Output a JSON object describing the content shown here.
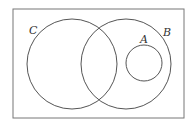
{
  "diagram": {
    "type": "venn",
    "universe": {
      "x": 13,
      "y": 9,
      "width": 171,
      "height": 109
    },
    "sets": [
      {
        "id": "C",
        "label": "C",
        "cx": 72,
        "cy": 64,
        "r": 45,
        "label_x": 29,
        "label_y": 34
      },
      {
        "id": "B",
        "label": "B",
        "cx": 126,
        "cy": 64,
        "r": 45,
        "label_x": 163,
        "label_y": 36
      },
      {
        "id": "A",
        "label": "A",
        "cx": 144,
        "cy": 63,
        "r": 18,
        "label_x": 140,
        "label_y": 43
      }
    ],
    "relations": [
      "A is a subset of B",
      "A and C are disjoint",
      "B and C overlap"
    ],
    "stroke_color": "#555555"
  }
}
